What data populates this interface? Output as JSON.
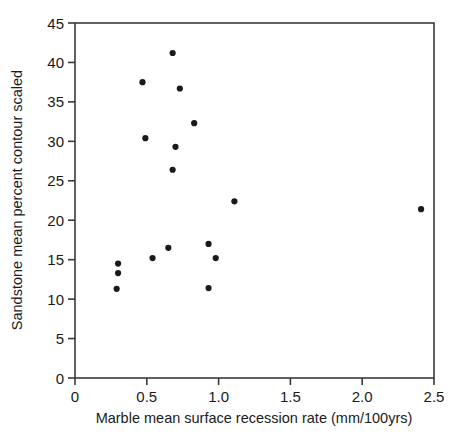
{
  "chart_data": {
    "type": "scatter",
    "title": "",
    "xlabel": "Marble mean surface recession rate (mm/100yrs)",
    "ylabel": "Sandstone mean percent contour scaled",
    "xlim": [
      0,
      2.5
    ],
    "ylim": [
      0,
      45
    ],
    "xticks": [
      0,
      0.5,
      1.0,
      1.5,
      2.0,
      2.5
    ],
    "xtick_labels": [
      "0",
      "0.5",
      "1.0",
      "1.5",
      "2.0",
      "2.5"
    ],
    "yticks": [
      0,
      5,
      10,
      15,
      20,
      25,
      30,
      35,
      40,
      45
    ],
    "ytick_labels": [
      "0",
      "5",
      "10",
      "15",
      "20",
      "25",
      "30",
      "35",
      "40",
      "45"
    ],
    "grid": false,
    "legend": null,
    "marker": "filled-circle",
    "marker_color": "#1a1a1a",
    "points": [
      {
        "x": 0.3,
        "y": 14.5
      },
      {
        "x": 0.3,
        "y": 13.3
      },
      {
        "x": 0.29,
        "y": 11.3
      },
      {
        "x": 0.47,
        "y": 37.5
      },
      {
        "x": 0.49,
        "y": 30.4
      },
      {
        "x": 0.54,
        "y": 15.2
      },
      {
        "x": 0.65,
        "y": 16.5
      },
      {
        "x": 0.68,
        "y": 41.2
      },
      {
        "x": 0.68,
        "y": 26.4
      },
      {
        "x": 0.7,
        "y": 29.3
      },
      {
        "x": 0.73,
        "y": 36.7
      },
      {
        "x": 0.83,
        "y": 32.3
      },
      {
        "x": 0.93,
        "y": 17.0
      },
      {
        "x": 0.93,
        "y": 11.4
      },
      {
        "x": 0.98,
        "y": 15.2
      },
      {
        "x": 1.11,
        "y": 22.4
      },
      {
        "x": 2.41,
        "y": 21.4
      }
    ]
  },
  "axes": {
    "x_axis_title": "Marble mean surface recession rate (mm/100yrs)",
    "y_axis_title": "Sandstone mean percent contour scaled"
  }
}
